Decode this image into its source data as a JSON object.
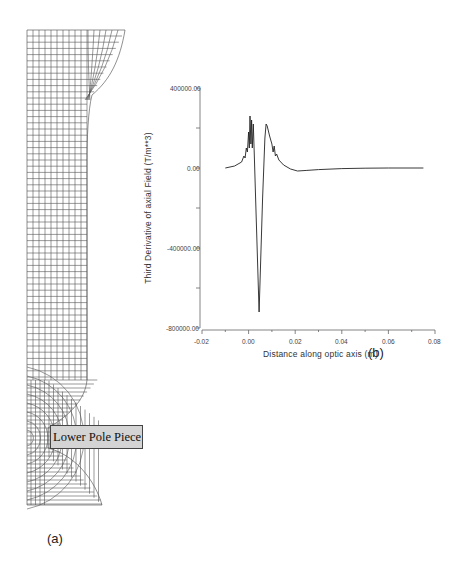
{
  "figure": {
    "panel_a": {
      "label": "(a)",
      "description": "Finite element mesh of magnetic lens region",
      "annotation": "Lower Pole Piece"
    },
    "panel_b": {
      "label": "(b)"
    }
  },
  "chart_data": {
    "type": "line",
    "title": "",
    "xlabel": "Distance along optic axis (m)",
    "ylabel": "Third Derivative of axial Field (T/m**3)",
    "xlim": [
      -0.02,
      0.08
    ],
    "ylim": [
      -800000,
      400000
    ],
    "x_ticks": [
      "-0.02",
      "0.00",
      "0.02",
      "0.04",
      "0.06",
      "0.08"
    ],
    "y_ticks": [
      "400000.00",
      "0.00",
      "-400000.00",
      "-800000.00"
    ],
    "grid": false,
    "legend": null,
    "series": [
      {
        "name": "Third derivative",
        "x": [
          -0.01,
          -0.006,
          -0.003,
          -0.002,
          -0.0015,
          -0.001,
          -0.0005,
          0.0,
          0.0003,
          0.0006,
          0.001,
          0.0013,
          0.0016,
          0.002,
          0.0025,
          0.003,
          0.0045,
          0.006,
          0.007,
          0.0075,
          0.008,
          0.009,
          0.01,
          0.0105,
          0.011,
          0.0115,
          0.012,
          0.013,
          0.015,
          0.018,
          0.021,
          0.025,
          0.03,
          0.04,
          0.05,
          0.06,
          0.075
        ],
        "values": [
          0,
          10000,
          30000,
          60000,
          50000,
          100000,
          80000,
          180000,
          100000,
          260000,
          120000,
          240000,
          100000,
          220000,
          50000,
          -150000,
          -720000,
          -150000,
          150000,
          220000,
          210000,
          160000,
          120000,
          80000,
          110000,
          60000,
          70000,
          40000,
          15000,
          -5000,
          -15000,
          -12000,
          -8000,
          -3000,
          -1000,
          0,
          0
        ]
      }
    ]
  }
}
